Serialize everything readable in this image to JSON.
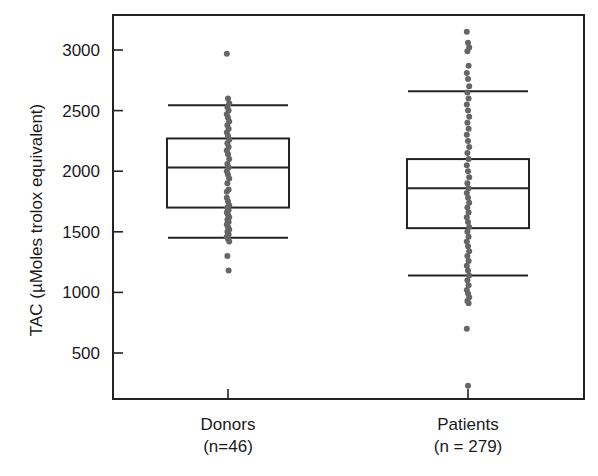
{
  "chart_data": {
    "type": "box",
    "title": "",
    "xlabel": "",
    "ylabel": "TAC (µMoles trolox equivalent)",
    "ylim": [
      120,
      3290
    ],
    "yticks": [
      500,
      1000,
      1500,
      2000,
      2500,
      3000
    ],
    "grid": false,
    "legend": null,
    "categories": [
      {
        "label": "Donors",
        "sublabel": "(n=46)",
        "n": 46
      },
      {
        "label": "Patients",
        "sublabel": "(n = 279)",
        "n": 279
      }
    ],
    "series": [
      {
        "name": "Donors",
        "whisker_high": 2545,
        "q3": 2270,
        "median": 2030,
        "q1": 1700,
        "whisker_low": 1450,
        "points": [
          2970,
          2600,
          2560,
          2530,
          2500,
          2470,
          2440,
          2410,
          2380,
          2350,
          2320,
          2290,
          2260,
          2230,
          2200,
          2170,
          2140,
          2100,
          2060,
          2030,
          2000,
          1970,
          1940,
          1900,
          1850,
          1780,
          1750,
          1720,
          1700,
          1680,
          1660,
          1640,
          1620,
          1600,
          1580,
          1560,
          1540,
          1520,
          1500,
          1480,
          1460,
          1440,
          1420,
          1300,
          1180,
          1830
        ]
      },
      {
        "name": "Patients",
        "whisker_high": 2660,
        "q3": 2100,
        "median": 1860,
        "q1": 1530,
        "whisker_low": 1140,
        "points": [
          3150,
          3060,
          3020,
          2990,
          2870,
          2810,
          2760,
          2700,
          2650,
          2600,
          2550,
          2500,
          2450,
          2400,
          2350,
          2300,
          2250,
          2200,
          2150,
          2100,
          2050,
          2000,
          1950,
          1900,
          1860,
          1820,
          1780,
          1740,
          1700,
          1660,
          1620,
          1580,
          1540,
          1500,
          1460,
          1420,
          1380,
          1340,
          1300,
          1260,
          1220,
          1180,
          1140,
          1100,
          1060,
          1020,
          990,
          960,
          930,
          910,
          700,
          230
        ]
      }
    ]
  }
}
